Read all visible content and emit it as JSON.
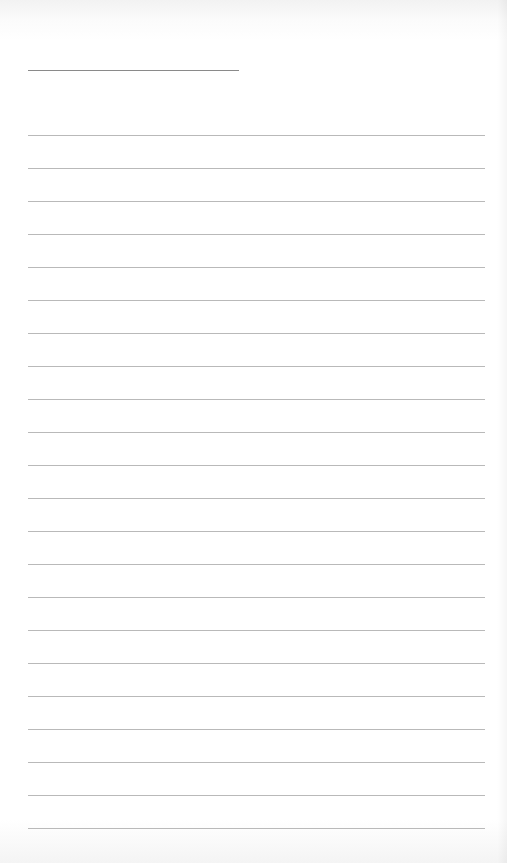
{
  "document": {
    "type": "blank lined paper",
    "title_line": {
      "present": true,
      "text": ""
    },
    "ruled_lines": {
      "count": 22,
      "text": [
        "",
        "",
        "",
        "",
        "",
        "",
        "",
        "",
        "",
        "",
        "",
        "",
        "",
        "",
        "",
        "",
        "",
        "",
        "",
        "",
        "",
        ""
      ]
    },
    "colors": {
      "paper": "#ffffff",
      "rule": "#b9b9b9",
      "title_rule": "#8a8a8a"
    }
  }
}
